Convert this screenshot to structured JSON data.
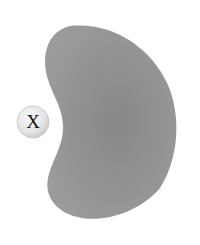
{
  "diagram": {
    "shape": {
      "kind": "kidney-bean-blob",
      "fill": "#8f8f8f",
      "fill_center": "#888888",
      "fill_edge": "#9a9a9a"
    },
    "ligand": {
      "label": "X",
      "fill_light": "#f4f4f4",
      "fill_dark": "#cfcfcf",
      "stroke": "#bdbdbd"
    }
  }
}
